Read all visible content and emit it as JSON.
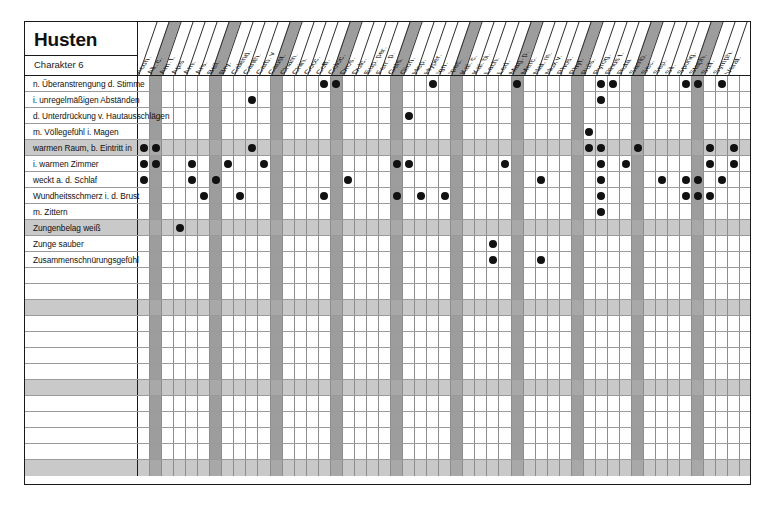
{
  "page": {
    "title": "Husten",
    "subtitle": "Charakter 6",
    "background_color": "#ffffff",
    "frame_color": "#1a1a1a",
    "band_color": "#c9c9c9",
    "shaded_column_color": "#9d9d9d",
    "dot_color": "#111111"
  },
  "chart_data": {
    "type": "table",
    "title": "Husten",
    "subtitle": "Charakter 6",
    "xlabel": "",
    "ylabel": "",
    "legend_position": "none",
    "grid": true,
    "shaded_column_indices": [
      1,
      6,
      11,
      16,
      21,
      26,
      31,
      36,
      41,
      46
    ],
    "banded_row_indices": [
      5,
      11,
      16,
      21,
      26
    ],
    "columns": [
      "Acon.",
      "All. c.",
      "Am. t.",
      "Apis",
      "Arn.",
      "Ars.",
      "Bell.",
      "Bry.",
      "Calend.",
      "Canth.",
      "Carb. v",
      "Caust.",
      "Cham.",
      "Chin.",
      "Cocc.",
      "Coff.",
      "Coloc.",
      "Dros.",
      "Dulc.",
      "Eup. per.",
      "Ferr. p.",
      "Gels.",
      "Glon.",
      "Hep.",
      "Hyper.",
      "Ign.",
      "Ipec.",
      "Kal. c.",
      "Kal. bi.",
      "Lach.",
      "Led.",
      "Mag. p.",
      "Merc.",
      "Nat. m.",
      "Nux v.",
      "Phos.",
      "Phyt.",
      "Puls.",
      "Pyrog.",
      "Rhus t.",
      "Ruta",
      "Samb.",
      "Sec.",
      "Sep.",
      "Sil.",
      "Spong.",
      "Staph.",
      "Sulf.",
      "Symph.",
      "Verat."
    ],
    "rows": [
      {
        "label": "n. Überanstrengung d. Stimme",
        "band": false,
        "marks": [
          15,
          16,
          24,
          31,
          38,
          39,
          45,
          46,
          48
        ]
      },
      {
        "label": "i. unregelmäßigen Abständen",
        "band": false,
        "marks": [
          9,
          38
        ]
      },
      {
        "label": "d. Unterdrückung v. Hautausschlägen",
        "band": false,
        "marks": [
          22
        ]
      },
      {
        "label": "m. Völlegefühl i. Magen",
        "band": false,
        "marks": [
          37
        ]
      },
      {
        "label": "warmen Raum, b. Eintritt in",
        "band": true,
        "marks": [
          0,
          1,
          9,
          37,
          38,
          41,
          47,
          49
        ]
      },
      {
        "label": "i. warmen Zimmer",
        "band": false,
        "marks": [
          0,
          1,
          4,
          7,
          10,
          21,
          22,
          30,
          38,
          40,
          47,
          49
        ]
      },
      {
        "label": "weckt a. d. Schlaf",
        "band": false,
        "marks": [
          0,
          4,
          6,
          17,
          33,
          38,
          43,
          45,
          46,
          48
        ]
      },
      {
        "label": "Wundheitsschmerz i. d. Brust",
        "band": false,
        "marks": [
          5,
          8,
          15,
          21,
          23,
          25,
          38,
          45,
          46,
          47
        ]
      },
      {
        "label": "m. Zittern",
        "band": false,
        "marks": [
          38
        ]
      },
      {
        "label": "Zungenbelag weiß",
        "band": true,
        "marks": [
          3
        ]
      },
      {
        "label": "Zunge sauber",
        "band": false,
        "marks": [
          29
        ]
      },
      {
        "label": "Zusammenschnürungsgefühl",
        "band": false,
        "marks": [
          29,
          33
        ]
      },
      {
        "label": "",
        "band": false,
        "marks": []
      },
      {
        "label": "",
        "band": false,
        "marks": []
      },
      {
        "label": "",
        "band": true,
        "marks": []
      },
      {
        "label": "",
        "band": false,
        "marks": []
      },
      {
        "label": "",
        "band": false,
        "marks": []
      },
      {
        "label": "",
        "band": false,
        "marks": []
      },
      {
        "label": "",
        "band": false,
        "marks": []
      },
      {
        "label": "",
        "band": true,
        "marks": []
      },
      {
        "label": "",
        "band": false,
        "marks": []
      },
      {
        "label": "",
        "band": false,
        "marks": []
      },
      {
        "label": "",
        "band": false,
        "marks": []
      },
      {
        "label": "",
        "band": false,
        "marks": []
      },
      {
        "label": "",
        "band": true,
        "marks": []
      }
    ]
  }
}
